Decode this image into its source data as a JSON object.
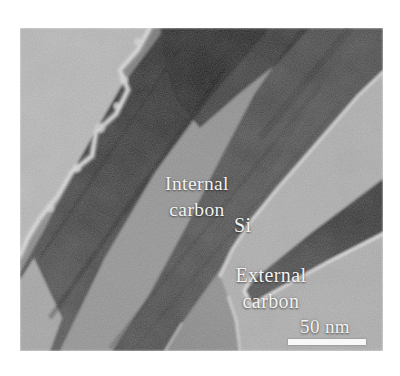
{
  "figure": {
    "labels": {
      "internal_carbon": {
        "line1": "Internal",
        "line2": "carbon"
      },
      "si": "Si",
      "external_carbon": {
        "line1": "External",
        "line2": "carbon"
      }
    },
    "scale_bar": {
      "label": "50 nm"
    },
    "colors": {
      "page_background": "#ffffff",
      "vacuum_light_gray": "#c0c0c0",
      "background_gray": "#b5b5b5",
      "core_gray": "#8f8f8f",
      "dark_band": "#1f1f1f",
      "medium_band": "#404040",
      "bright_edge": "#efefef",
      "label_text": "#f2f2f2",
      "scale_bar_fill": "#f8f8f8"
    }
  }
}
